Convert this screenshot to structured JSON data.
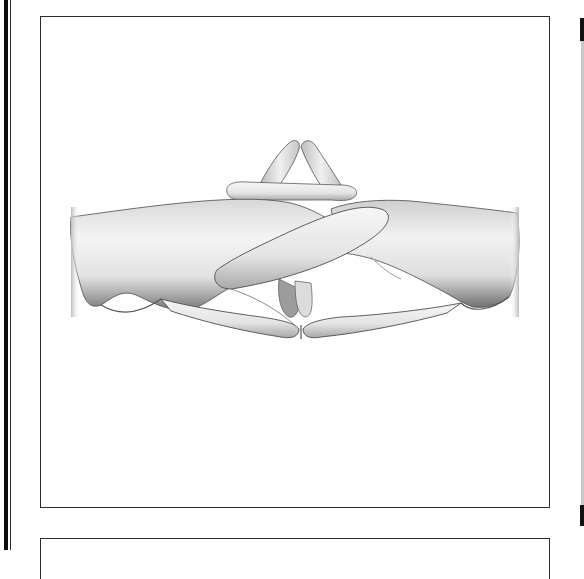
{
  "figure": {
    "subject": "two hands with interlaced fingers, steepled index fingers pointing up, thumbs touching at bottom",
    "render_style": "grayscale 3D shaded model, halftone scan",
    "icon": "hands-steepled-icon"
  },
  "colors": {
    "border": "#2b2b2b",
    "edge_bar": "#0d0d0d",
    "background": "#ffffff",
    "skin_light": "#f2f2f2",
    "skin_mid": "#c8c8c8",
    "skin_shadow": "#6e6e6e"
  }
}
